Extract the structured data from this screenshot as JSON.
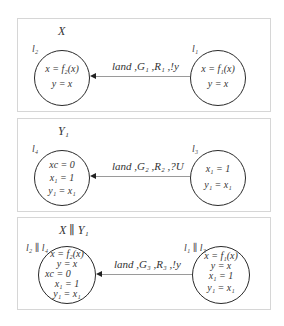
{
  "panels": [
    {
      "title": "X",
      "edge_label": "land ,G₁ ,R₁ ,!y",
      "source_state": {
        "label": "l₁",
        "lines": [
          "x = f₁(x)",
          "y = x"
        ]
      },
      "target_state": {
        "label": "l₂",
        "lines": [
          "x = f₂(x)",
          "y = x"
        ]
      }
    },
    {
      "title": "Y₁",
      "edge_label": "land ,G₂ ,R₂ ,?U",
      "source_state": {
        "label": "l₃",
        "lines": [
          "x₁ = 1",
          "y₁ = x₁"
        ]
      },
      "target_state": {
        "label": "l₄",
        "lines": [
          "xс = 0",
          "x₁ = 1",
          "y₁ = x₁"
        ]
      }
    },
    {
      "title": "X ∥ Y₁",
      "edge_label": "land ,G₃ ,R₃ ,!y",
      "source_state": {
        "label": "l₁ ∥ l₃",
        "lines": [
          "x = f₁(x)",
          "y = x",
          "x₁ = 1",
          "y₁ = x₁"
        ]
      },
      "target_state": {
        "label": "l₂ ∥ l₄",
        "lines": [
          "x = f₂(x)",
          "y = x",
          "xс = 0",
          "x₁ = 1",
          "y₁ = x₁"
        ]
      }
    }
  ]
}
